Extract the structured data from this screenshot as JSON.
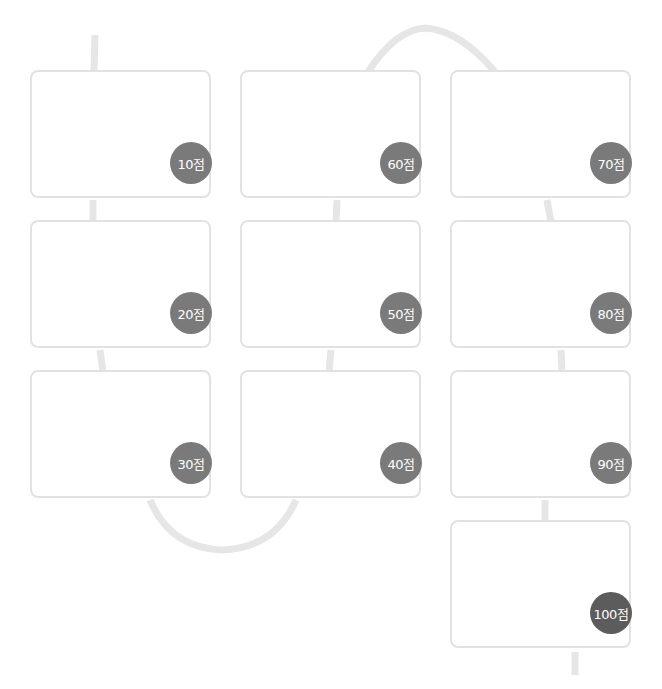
{
  "diagram": {
    "type": "score-path",
    "unit": "점",
    "colors": {
      "path": "#e6e6e6",
      "card_border": "#e2e2e2",
      "badge": "#7a7a7a",
      "badge_final": "#5c5c5c"
    },
    "cards": [
      {
        "score": "10점",
        "col": 0,
        "row": 0
      },
      {
        "score": "20점",
        "col": 0,
        "row": 1
      },
      {
        "score": "30점",
        "col": 0,
        "row": 2
      },
      {
        "score": "40점",
        "col": 1,
        "row": 2
      },
      {
        "score": "50점",
        "col": 1,
        "row": 1
      },
      {
        "score": "60점",
        "col": 1,
        "row": 0
      },
      {
        "score": "70점",
        "col": 2,
        "row": 0
      },
      {
        "score": "80점",
        "col": 2,
        "row": 1
      },
      {
        "score": "90점",
        "col": 2,
        "row": 2
      },
      {
        "score": "100점",
        "col": 2,
        "row": 3
      }
    ]
  }
}
